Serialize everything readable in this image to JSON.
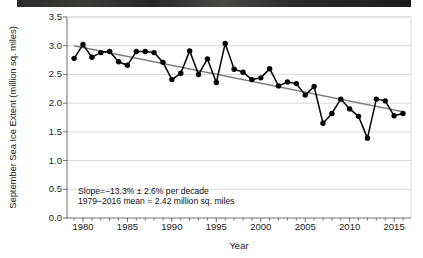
{
  "chart_data": {
    "type": "line",
    "title": "",
    "xlabel": "Year",
    "ylabel": "September Sea Ice Extent (million sq. miles)",
    "xlim": [
      1978.2,
      1976.0
    ],
    "x_range": [
      1978.2,
      2016.8
    ],
    "ylim": [
      0.0,
      3.5
    ],
    "grid": "horizontal",
    "legend": "none",
    "y_ticks": [
      "3.5",
      "3.0",
      "2.5",
      "2.0",
      "1.5",
      "1.0",
      "0.5",
      "0.0"
    ],
    "y_tick_values": [
      3.5,
      3.0,
      2.5,
      2.0,
      1.5,
      1.0,
      0.5,
      0.0
    ],
    "x_ticks": [
      "1980",
      "1985",
      "1990",
      "1995",
      "2000",
      "2005",
      "2010",
      "2015"
    ],
    "x_tick_values": [
      1980,
      1985,
      1990,
      1995,
      2000,
      2005,
      2010,
      2015
    ],
    "x_minor_tick_step": 1,
    "x": [
      1979,
      1980,
      1981,
      1982,
      1983,
      1984,
      1985,
      1986,
      1987,
      1988,
      1989,
      1990,
      1991,
      1992,
      1993,
      1994,
      1995,
      1996,
      1997,
      1998,
      1999,
      2000,
      2001,
      2002,
      2003,
      2004,
      2005,
      2006,
      2007,
      2008,
      2009,
      2010,
      2011,
      2012,
      2013,
      2014,
      2015,
      2016
    ],
    "values": [
      2.78,
      3.02,
      2.8,
      2.88,
      2.9,
      2.72,
      2.66,
      2.9,
      2.9,
      2.88,
      2.71,
      2.41,
      2.52,
      2.91,
      2.5,
      2.77,
      2.36,
      3.04,
      2.59,
      2.54,
      2.41,
      2.44,
      2.6,
      2.3,
      2.37,
      2.34,
      2.14,
      2.29,
      1.65,
      1.82,
      2.07,
      1.9,
      1.77,
      1.39,
      2.07,
      2.04,
      1.78,
      1.82
    ],
    "series": [
      {
        "name": "September sea ice extent",
        "marker": "filled-circle",
        "color": "#000000",
        "values": [
          2.78,
          3.02,
          2.8,
          2.88,
          2.9,
          2.72,
          2.66,
          2.9,
          2.9,
          2.88,
          2.71,
          2.41,
          2.52,
          2.91,
          2.5,
          2.77,
          2.36,
          3.04,
          2.59,
          2.54,
          2.41,
          2.44,
          2.6,
          2.3,
          2.37,
          2.34,
          2.14,
          2.29,
          1.65,
          1.82,
          2.07,
          1.9,
          1.77,
          1.39,
          2.07,
          2.04,
          1.78,
          1.82
        ]
      },
      {
        "name": "linear trend",
        "type": "trendline",
        "color": "#808080",
        "endpoints": [
          [
            1979,
            3.0
          ],
          [
            2016,
            1.85
          ]
        ]
      }
    ],
    "annotations": [
      "Slope=−13.3% ± 2.6% per decade",
      "1979–2016 mean = 2.42 million sq. miles"
    ]
  },
  "axes": {
    "y_title": "September Sea Ice Extent (million sq. miles)",
    "x_title": "Year"
  },
  "annotations": {
    "slope": "Slope=−13.3% ± 2.6% per decade",
    "mean": "1979–2016 mean = 2.42 million sq. miles"
  },
  "colors": {
    "data_line": "#000000",
    "trend_line": "#808080",
    "grid": "#d9d9d9",
    "axis": "#6e6e6e",
    "text": "#1a1a1a"
  }
}
